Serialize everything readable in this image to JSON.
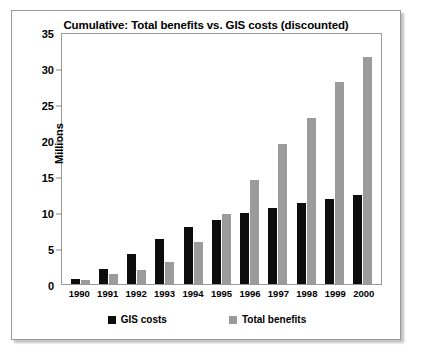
{
  "card": {
    "title": "Cumulative: Total benefits vs. GIS costs (discounted)"
  },
  "chart_data": {
    "type": "bar",
    "title": "Cumulative: Total benefits vs. GIS costs (discounted)",
    "xlabel": "",
    "ylabel": "Millions",
    "ylim": [
      0,
      35
    ],
    "yticks": [
      0,
      5,
      10,
      15,
      20,
      25,
      30,
      35
    ],
    "grid": false,
    "legend_position": "bottom",
    "categories": [
      "1990",
      "1991",
      "1992",
      "1993",
      "1994",
      "1995",
      "1996",
      "1997",
      "1998",
      "1999",
      "2000"
    ],
    "series": [
      {
        "name": "GIS costs",
        "color": "#0d0d0d",
        "values": [
          0.7,
          2.1,
          4.2,
          6.3,
          7.9,
          8.9,
          9.9,
          10.6,
          11.2,
          11.8,
          12.4
        ]
      },
      {
        "name": "Total benefits",
        "color": "#9b9b9b",
        "values": [
          0.6,
          1.4,
          1.9,
          3.1,
          5.8,
          9.7,
          14.4,
          19.4,
          23.0,
          28.0,
          31.5
        ]
      }
    ]
  }
}
